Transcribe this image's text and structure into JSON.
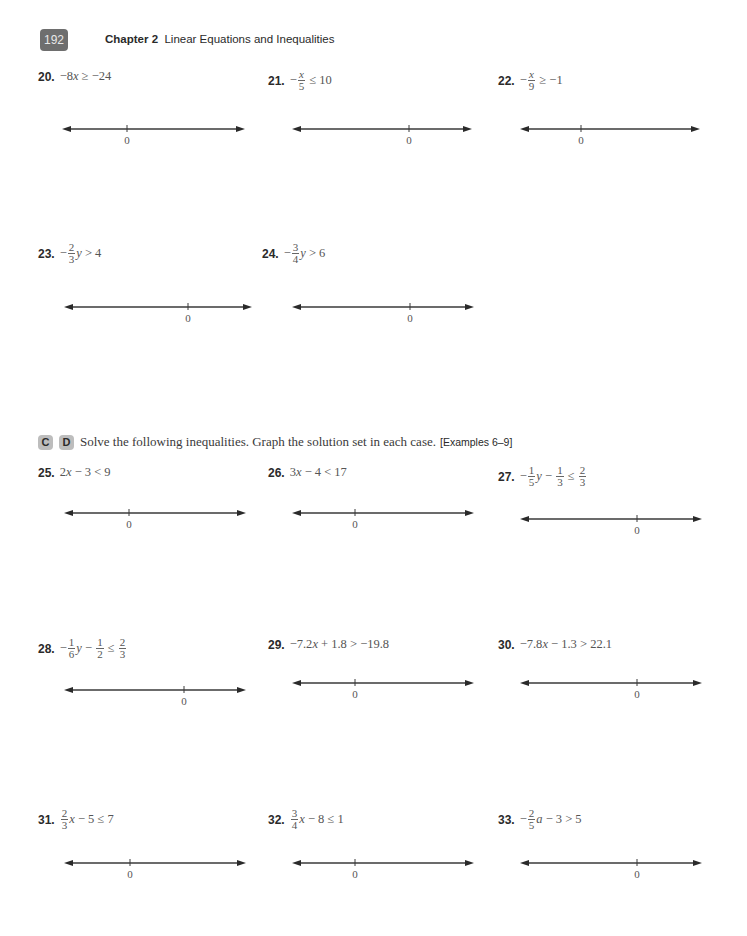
{
  "header": {
    "page_number": "192",
    "chapter_label": "Chapter 2",
    "chapter_title": "Linear Equations and Inequalities"
  },
  "section": {
    "levels": [
      "C",
      "D"
    ],
    "instructions": "Solve the following inequalities. Graph the solution set in each case.",
    "examples_ref": "[Examples 6–9]"
  },
  "problems": [
    {
      "number": "20.",
      "parts": [
        {
          "t": "−8"
        },
        {
          "v": "x"
        },
        {
          "t": " ≥ −24"
        }
      ],
      "zero_label": "0"
    },
    {
      "number": "21.",
      "parts": [
        {
          "t": "−"
        },
        {
          "fn": "x",
          "fd": "5",
          "ital": true
        },
        {
          "t": " ≤ 10"
        }
      ],
      "zero_label": "0"
    },
    {
      "number": "22.",
      "parts": [
        {
          "t": "−"
        },
        {
          "fn": "x",
          "fd": "9",
          "ital": true
        },
        {
          "t": " ≥ −1"
        }
      ],
      "zero_label": "0"
    },
    {
      "number": "23.",
      "parts": [
        {
          "t": "−"
        },
        {
          "fn": "2",
          "fd": "3"
        },
        {
          "v": "y"
        },
        {
          "t": " > 4"
        }
      ],
      "zero_label": "0"
    },
    {
      "number": "24.",
      "parts": [
        {
          "t": "−"
        },
        {
          "fn": "3",
          "fd": "4"
        },
        {
          "v": "y"
        },
        {
          "t": " > 6"
        }
      ],
      "zero_label": "0"
    },
    {
      "number": "25.",
      "parts": [
        {
          "t": "2"
        },
        {
          "v": "x"
        },
        {
          "t": " − 3 < 9"
        }
      ],
      "zero_label": "0"
    },
    {
      "number": "26.",
      "parts": [
        {
          "t": "3"
        },
        {
          "v": "x"
        },
        {
          "t": " − 4 < 17"
        }
      ],
      "zero_label": "0"
    },
    {
      "number": "27.",
      "parts": [
        {
          "t": "−"
        },
        {
          "fn": "1",
          "fd": "5"
        },
        {
          "v": "y"
        },
        {
          "t": " − "
        },
        {
          "fn": "1",
          "fd": "3"
        },
        {
          "t": " ≤ "
        },
        {
          "fn": "2",
          "fd": "3"
        }
      ],
      "zero_label": "0"
    },
    {
      "number": "28.",
      "parts": [
        {
          "t": "−"
        },
        {
          "fn": "1",
          "fd": "6"
        },
        {
          "v": "y"
        },
        {
          "t": " − "
        },
        {
          "fn": "1",
          "fd": "2"
        },
        {
          "t": " ≤ "
        },
        {
          "fn": "2",
          "fd": "3"
        }
      ],
      "zero_label": "0"
    },
    {
      "number": "29.",
      "parts": [
        {
          "t": "−7.2"
        },
        {
          "v": "x"
        },
        {
          "t": " + 1.8 > −19.8"
        }
      ],
      "zero_label": "0"
    },
    {
      "number": "30.",
      "parts": [
        {
          "t": "−7.8"
        },
        {
          "v": "x"
        },
        {
          "t": " − 1.3 > 22.1"
        }
      ],
      "zero_label": "0"
    },
    {
      "number": "31.",
      "parts": [
        {
          "fn": "2",
          "fd": "3"
        },
        {
          "v": "x"
        },
        {
          "t": " − 5 ≤ 7"
        }
      ],
      "zero_label": "0"
    },
    {
      "number": "32.",
      "parts": [
        {
          "fn": "3",
          "fd": "4"
        },
        {
          "v": "x"
        },
        {
          "t": " − 8 ≤ 1"
        }
      ],
      "zero_label": "0"
    },
    {
      "number": "33.",
      "parts": [
        {
          "t": "−"
        },
        {
          "fn": "2",
          "fd": "5"
        },
        {
          "v": "a"
        },
        {
          "t": " − 3 > 5"
        }
      ],
      "zero_label": "0"
    }
  ]
}
